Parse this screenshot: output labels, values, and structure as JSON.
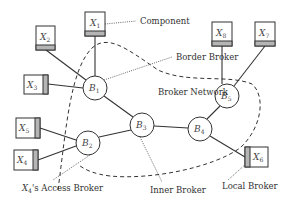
{
  "diagram": {
    "colors": {
      "stroke": "#333333",
      "shade": "#b5b5b5",
      "box_fill": "#ffffff",
      "text": "#333333"
    },
    "brokers": [
      {
        "id": "B1",
        "base": "B",
        "sub": "1",
        "cx": 95,
        "cy": 88,
        "r": 12
      },
      {
        "id": "B2",
        "base": "B",
        "sub": "2",
        "cx": 88,
        "cy": 143,
        "r": 12
      },
      {
        "id": "B3",
        "base": "B",
        "sub": "3",
        "cx": 142,
        "cy": 125,
        "r": 12
      },
      {
        "id": "B4",
        "base": "B",
        "sub": "4",
        "cx": 200,
        "cy": 129,
        "r": 12
      },
      {
        "id": "B5",
        "base": "B",
        "sub": "5",
        "cx": 227,
        "cy": 96,
        "r": 12
      }
    ],
    "components": [
      {
        "id": "X1",
        "base": "X",
        "sub": "1",
        "x": 85,
        "y": 12,
        "w": 20,
        "h": 24,
        "shade": "bottom"
      },
      {
        "id": "X2",
        "base": "X",
        "sub": "2",
        "x": 36,
        "y": 26,
        "w": 19,
        "h": 24,
        "shade": "bottom"
      },
      {
        "id": "X3",
        "base": "X",
        "sub": "3",
        "x": 24,
        "y": 75,
        "w": 24,
        "h": 19,
        "shade": "right"
      },
      {
        "id": "X4",
        "base": "X",
        "sub": "4",
        "x": 14,
        "y": 150,
        "w": 24,
        "h": 20,
        "shade": "right"
      },
      {
        "id": "X5",
        "base": "X",
        "sub": "5",
        "x": 16,
        "y": 118,
        "w": 24,
        "h": 20,
        "shade": "right"
      },
      {
        "id": "X6",
        "base": "X",
        "sub": "6",
        "x": 245,
        "y": 147,
        "w": 23,
        "h": 20,
        "shade": "left"
      },
      {
        "id": "X7",
        "base": "X",
        "sub": "7",
        "x": 255,
        "y": 22,
        "w": 20,
        "h": 24,
        "shade": "bottom"
      },
      {
        "id": "X8",
        "base": "X",
        "sub": "8",
        "x": 212,
        "y": 22,
        "w": 20,
        "h": 24,
        "shade": "bottom"
      }
    ],
    "edges": [
      {
        "from": "X1",
        "to": "B1"
      },
      {
        "from": "X2",
        "to": "B1"
      },
      {
        "from": "X3",
        "to": "B1"
      },
      {
        "from": "B1",
        "to": "B3"
      },
      {
        "from": "X5",
        "to": "B2"
      },
      {
        "from": "X4",
        "to": "B2"
      },
      {
        "from": "B2",
        "to": "B3"
      },
      {
        "from": "B3",
        "to": "B4"
      },
      {
        "from": "B4",
        "to": "B5"
      },
      {
        "from": "X8",
        "to": "B5"
      },
      {
        "from": "X7",
        "to": "B5"
      },
      {
        "from": "B4",
        "to": "X6"
      }
    ],
    "annotations": [
      {
        "id": "component",
        "text": "Component",
        "x": 140,
        "y": 24
      },
      {
        "id": "border-broker",
        "text": "Border Broker",
        "x": 176,
        "y": 60
      },
      {
        "id": "broker-network",
        "text": "Broker Network",
        "x": 158,
        "y": 95
      },
      {
        "id": "access-broker",
        "text": "X₄'s Access Broker",
        "x": 22,
        "y": 191
      },
      {
        "id": "inner-broker",
        "text": "Inner Broker",
        "x": 150,
        "y": 193
      },
      {
        "id": "local-broker",
        "text": "Local Broker",
        "x": 222,
        "y": 189
      }
    ],
    "labels": {
      "component": "Component",
      "border_broker": "Border Broker",
      "broker_network": "Broker Network",
      "access_broker_prefix": "X",
      "access_broker_sub": "4",
      "access_broker_suffix": "'s Access Broker",
      "inner_broker": "Inner Broker",
      "local_broker": "Local Broker"
    }
  }
}
